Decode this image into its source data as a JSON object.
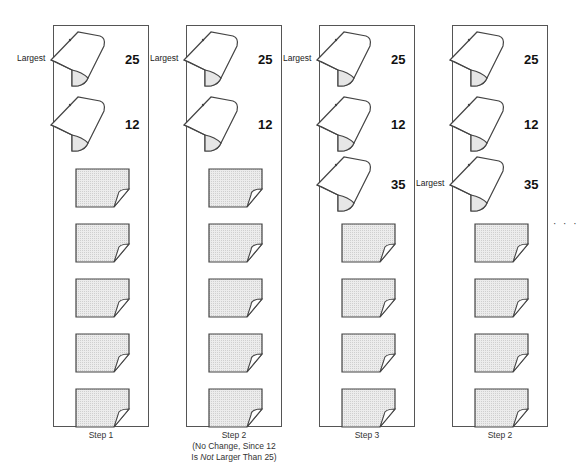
{
  "marker_label": "Largest",
  "ellipsis": "· · ·",
  "colors": {
    "outline": "#444444",
    "card_fill": "#e6e6e6",
    "box_border": "#555555"
  },
  "steps": [
    {
      "label_lines": [
        "Step 1"
      ],
      "turned_cards": [
        {
          "value": "25",
          "largest": true
        },
        {
          "value": "12",
          "largest": false
        }
      ],
      "face_down_count": 5
    },
    {
      "label_lines": [
        "Step 2",
        "(No Change, Since 12",
        "Is Not Larger Than 25)"
      ],
      "turned_cards": [
        {
          "value": "25",
          "largest": true
        },
        {
          "value": "12",
          "largest": false
        }
      ],
      "face_down_count": 5
    },
    {
      "label_lines": [
        "Step 3"
      ],
      "turned_cards": [
        {
          "value": "25",
          "largest": true
        },
        {
          "value": "12",
          "largest": false
        },
        {
          "value": "35",
          "largest": false
        }
      ],
      "face_down_count": 4
    },
    {
      "label_lines": [
        "Step 2"
      ],
      "turned_cards": [
        {
          "value": "25",
          "largest": false
        },
        {
          "value": "12",
          "largest": false
        },
        {
          "value": "35",
          "largest": true
        }
      ],
      "face_down_count": 4
    }
  ]
}
